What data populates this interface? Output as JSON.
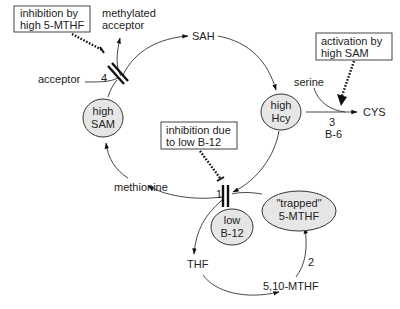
{
  "diagram": {
    "metabolites": {
      "sah": "SAH",
      "methylated_acceptor_line1": "methylated",
      "methylated_acceptor_line2": "acceptor",
      "acceptor": "acceptor",
      "methionine": "methionine",
      "thf": "THF",
      "methylene_thf": "5,10-MTHF",
      "serine": "serine",
      "cys": "CYS"
    },
    "ellipses": {
      "sam": {
        "line1": "high",
        "line2": "SAM"
      },
      "hcy": {
        "line1": "high",
        "line2": "Hcy"
      },
      "b12": {
        "line1": "low",
        "line2": "B-12"
      },
      "mthf": {
        "line1": "\"trapped\"",
        "line2": "5-MTHF"
      }
    },
    "boxes": {
      "inhibition_mthf": {
        "line1": "inhibition by",
        "line2": "high 5-MTHF"
      },
      "activation_sam": {
        "line1": "activation by",
        "line2": "high SAM"
      },
      "inhibition_b12": {
        "line1": "inhibition due",
        "line2": "to low B-12"
      }
    },
    "enzyme_labels": {
      "e1": "1",
      "e2": "2",
      "e3": "3",
      "e3_cofactor": "B-6",
      "e4": "4"
    },
    "colors": {
      "ellipse_fill": "#e6e6e6",
      "line": "#333333",
      "text": "#222222"
    }
  }
}
